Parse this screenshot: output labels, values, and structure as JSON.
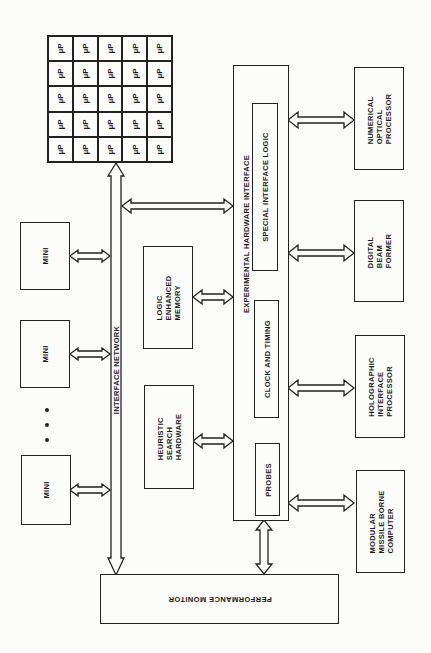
{
  "diagram": {
    "processor_array": {
      "rows": 5,
      "cols": 5,
      "cell_label": "μP"
    },
    "bus": {
      "label": "INTERFACE NETWORK"
    },
    "minis": [
      {
        "label": "MINI"
      },
      {
        "label": "MINI"
      },
      {
        "label": "MINI"
      }
    ],
    "ellipsis": "• • •",
    "logic_memory": {
      "label": "LOGIC\nENHANCED\nMEMORY"
    },
    "heuristic": {
      "label": "HEURISTIC\nSEARCH\nHARDWARE"
    },
    "ehi": {
      "label": "EXPERIMENTAL HARDWARE INTERFACE",
      "special": "SPECIAL INTERFACE LOGIC",
      "clock": "CLOCK AND TIMING",
      "probes": "PROBES"
    },
    "right_devices": [
      {
        "label": "NUMERICAL\nOPTICAL\nPROCESSOR"
      },
      {
        "label": "DIGITAL\nBEAM\nFORMER"
      },
      {
        "label": "HOLOGRAPHIC\nINTERFACE\nPROCESSOR"
      },
      {
        "label": "MODULAR\nMISSILE BORNE\nCOMPUTER"
      }
    ],
    "performance_monitor": {
      "label": "PERFORMANCE MONITOR"
    },
    "colors": {
      "ink": "#222222",
      "paper": "#fcfcfa"
    }
  }
}
